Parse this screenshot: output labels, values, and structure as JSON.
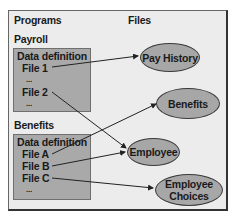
{
  "headers": {
    "programs": "Programs",
    "files": "Files"
  },
  "programs": [
    {
      "name": "Payroll",
      "lines": [
        "Data definition",
        "File 1",
        "...",
        "File 2",
        "..."
      ]
    },
    {
      "name": "Benefits",
      "lines": [
        "Data definition",
        "File A",
        "File B",
        "File C",
        "..."
      ]
    }
  ],
  "files": [
    {
      "label": "Pay History"
    },
    {
      "label": "Benefits"
    },
    {
      "label": "Employee"
    },
    {
      "label": "Employee Choices",
      "line1": "Employee",
      "line2": "Choices"
    }
  ],
  "links": [
    {
      "from": "Payroll.File 1",
      "to": "Pay History"
    },
    {
      "from": "Payroll.File 2",
      "to": "Employee"
    },
    {
      "from": "Benefits.File A",
      "to": "Benefits"
    },
    {
      "from": "Benefits.File B",
      "to": "Employee"
    },
    {
      "from": "Benefits.File C",
      "to": "Employee Choices"
    }
  ],
  "colors": {
    "frame_bg": "#ececec",
    "box_fill": "#a9a9a9",
    "ellipse_fill": "#a7a7a7",
    "line": "#222222"
  }
}
